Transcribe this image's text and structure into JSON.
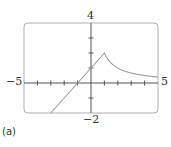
{
  "chart_data": {
    "type": "line",
    "title": "",
    "caption": "(a)",
    "xlabel": "",
    "ylabel": "",
    "xlim": [
      -5,
      5
    ],
    "ylim": [
      -2,
      4
    ],
    "grid": false,
    "tick_labels": {
      "xmin": "−5",
      "xmax": "5",
      "ymax": "4",
      "ymin": "−2"
    },
    "x_ticks": [
      -5,
      -4,
      -3,
      -2,
      -1,
      0,
      1,
      2,
      3,
      4,
      5
    ],
    "y_ticks": [
      -2,
      -1,
      0,
      1,
      2,
      3,
      4
    ],
    "series": [
      {
        "name": "piecewise f(x)",
        "description": "y = x + 1 for x <= 1; y = 2/x for x > 1 (cusp at (1, 2))",
        "x": [
          -3,
          -2,
          -1,
          0,
          1,
          1.5,
          2,
          2.5,
          3,
          3.5,
          4,
          4.5,
          5
        ],
        "values": [
          -2,
          -1,
          0,
          1,
          2,
          1.33,
          1.0,
          0.8,
          0.67,
          0.57,
          0.5,
          0.44,
          0.4
        ],
        "color": "#9a9a9a"
      }
    ],
    "frame_color": "#b0b0b0",
    "axis_color": "#555555"
  }
}
